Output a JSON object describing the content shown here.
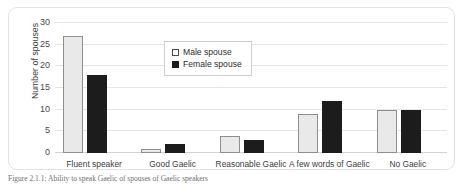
{
  "figure": {
    "caption": "Figure 2.1.1: Ability to speak Gaelic of spouses of Gaelic speakers"
  },
  "legend": {
    "position": "inside-top-center",
    "entries": [
      {
        "label": "Male spouse",
        "swatch": "open-square-swatch",
        "color": "#ffffff"
      },
      {
        "label": "Female spouse",
        "swatch": "filled-square-swatch",
        "color": "#1c1c1c"
      }
    ]
  },
  "chart_data": {
    "type": "bar",
    "title": "",
    "xlabel": "",
    "ylabel": "Number of spouses",
    "ylim": [
      0,
      30
    ],
    "yticks": [
      0,
      5,
      10,
      15,
      20,
      25,
      30
    ],
    "grid": true,
    "categories": [
      "Fluent speaker",
      "Good Gaelic",
      "Reasonable Gaelic",
      "A few words of Gaelic",
      "No Gaelic"
    ],
    "series": [
      {
        "name": "Male spouse",
        "color": "#e9e9e9",
        "values": [
          27,
          1,
          4,
          9,
          10
        ]
      },
      {
        "name": "Female spouse",
        "color": "#1c1c1c",
        "values": [
          18,
          2,
          3,
          12,
          10
        ]
      }
    ]
  }
}
